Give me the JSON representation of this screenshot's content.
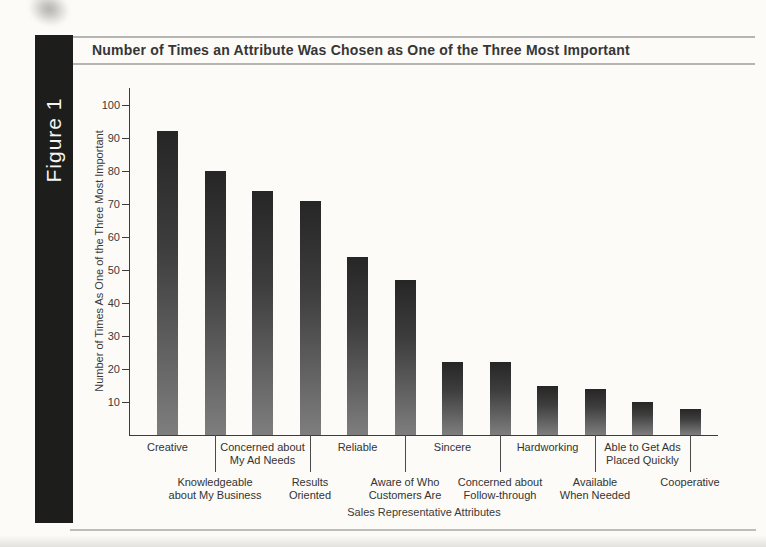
{
  "figure": {
    "sidebar_label": "Figure 1"
  },
  "colors": {
    "sidebar_bg": "#1d1d1b",
    "sidebar_text": "#f4f4f2",
    "title_rule": "#b5b5b3",
    "axis": "#3c3c3c",
    "text": "#363636",
    "bar_gradient_top": "#262626",
    "bar_gradient_bottom": "#7e7e7e"
  },
  "chart_data": {
    "type": "bar",
    "title": "Number of Times an Attribute Was Chosen as One of the Three Most Important",
    "xlabel": "Sales Representative Attributes",
    "ylabel": "Number of Times As One of the Three Most Important",
    "categories": [
      "Creative",
      "Knowledgeable about My Business",
      "Concerned about My Ad Needs",
      "Results Oriented",
      "Reliable",
      "Aware of Who Customers Are",
      "Sincere",
      "Concerned about Follow-through",
      "Hardworking",
      "Available When Needed",
      "Able to Get Ads Placed Quickly",
      "Cooperative"
    ],
    "values": [
      92,
      80,
      74,
      71,
      54,
      47,
      22,
      22,
      15,
      14,
      10,
      8
    ],
    "yticks": [
      10,
      20,
      30,
      40,
      50,
      60,
      70,
      80,
      90,
      100
    ],
    "ylim": [
      0,
      105
    ],
    "grid": false,
    "legend": null,
    "x_labels_row1": [
      [
        "Creative"
      ],
      [
        "Concerned about",
        "My Ad Needs"
      ],
      [
        "Reliable"
      ],
      [
        "Sincere"
      ],
      [
        "Hardworking"
      ],
      [
        "Able to Get Ads",
        "Placed Quickly"
      ]
    ],
    "x_labels_row2": [
      [
        "Knowledgeable",
        "about My Business"
      ],
      [
        "Results",
        "Oriented"
      ],
      [
        "Aware of Who",
        "Customers Are"
      ],
      [
        "Concerned about",
        "Follow-through"
      ],
      [
        "Available",
        "When Needed"
      ],
      [
        "Cooperative"
      ]
    ]
  }
}
